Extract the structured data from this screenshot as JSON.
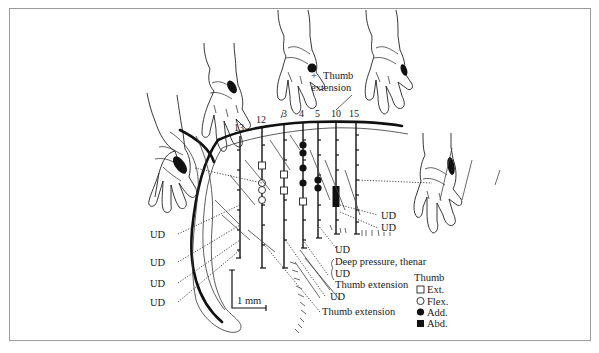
{
  "figure": {
    "track_numbers": [
      "13",
      "12",
      "3",
      "4",
      "5",
      "10",
      "15"
    ],
    "top_annotation": {
      "marker": "+",
      "line1": "Thumb",
      "line2": "extension"
    },
    "left_labels": [
      "UD",
      "UD",
      "UD",
      "UD"
    ],
    "right_labels": [
      "UD",
      "UD"
    ],
    "bottom_labels": {
      "ud_1": "UD",
      "deep_pressure": "Deep pressure, thenar",
      "ud_2": "UD",
      "thumb_ext_1": "Thumb extension",
      "ud_3": "UD",
      "thumb_ext_2": "Thumb extension"
    },
    "scale_bar": "1 mm",
    "legend": {
      "title": "Thumb",
      "items": [
        {
          "symbol": "open-square",
          "label": "Ext."
        },
        {
          "symbol": "open-circle",
          "label": "Flex."
        },
        {
          "symbol": "filled-circle",
          "label": "Add."
        },
        {
          "symbol": "filled-square",
          "label": "Abd."
        }
      ]
    },
    "colors": {
      "ink": "#111111",
      "frame": "#9a9a9a",
      "background": "#ffffff"
    }
  }
}
